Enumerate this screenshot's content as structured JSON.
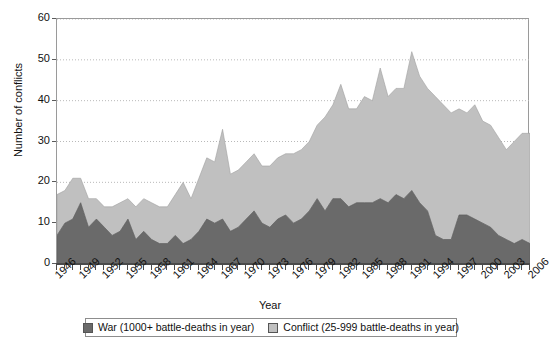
{
  "chart_data": {
    "type": "area",
    "stacked": true,
    "title": "",
    "xlabel": "Year",
    "ylabel": "Number of conflicts",
    "xlim": [
      1946,
      2006
    ],
    "ylim": [
      0,
      60
    ],
    "yticks": [
      0,
      10,
      20,
      30,
      40,
      50,
      60
    ],
    "xtick_labels": [
      "1946",
      "1949",
      "1952",
      "1955",
      "1958",
      "1961",
      "1964",
      "1967",
      "1970",
      "1973",
      "1976",
      "1979",
      "1982",
      "1985",
      "1988",
      "1991",
      "1994",
      "1997",
      "2000",
      "2003",
      "2006"
    ],
    "xtick_step": 3,
    "grid": "horizontal-dotted",
    "legend_position": "bottom",
    "x": [
      1946,
      1947,
      1948,
      1949,
      1950,
      1951,
      1952,
      1953,
      1954,
      1955,
      1956,
      1957,
      1958,
      1959,
      1960,
      1961,
      1962,
      1963,
      1964,
      1965,
      1966,
      1967,
      1968,
      1969,
      1970,
      1971,
      1972,
      1973,
      1974,
      1975,
      1976,
      1977,
      1978,
      1979,
      1980,
      1981,
      1982,
      1983,
      1984,
      1985,
      1986,
      1987,
      1988,
      1989,
      1990,
      1991,
      1992,
      1993,
      1994,
      1995,
      1996,
      1997,
      1998,
      1999,
      2000,
      2001,
      2002,
      2003,
      2004,
      2005,
      2006
    ],
    "series": [
      {
        "name": "War (1000+ battle-deaths in year)",
        "color": "#6a6a6a",
        "values": [
          7,
          10,
          11,
          15,
          9,
          11,
          9,
          7,
          8,
          11,
          6,
          8,
          6,
          5,
          5,
          7,
          5,
          6,
          8,
          11,
          10,
          11,
          8,
          9,
          11,
          13,
          10,
          9,
          11,
          12,
          10,
          11,
          13,
          16,
          13,
          16,
          16,
          14,
          15,
          15,
          15,
          16,
          15,
          17,
          16,
          18,
          15,
          13,
          7,
          6,
          6,
          12,
          12,
          11,
          10,
          9,
          7,
          6,
          5,
          6,
          5
        ]
      },
      {
        "name": "Conflict (25-999 battle-deaths in year)",
        "color": "#c0c0c0",
        "values": [
          10,
          8,
          10,
          6,
          7,
          5,
          5,
          7,
          7,
          5,
          8,
          8,
          9,
          9,
          9,
          10,
          15,
          10,
          13,
          15,
          15,
          22,
          14,
          14,
          14,
          14,
          14,
          15,
          15,
          15,
          17,
          17,
          17,
          18,
          23,
          23,
          28,
          24,
          23,
          26,
          25,
          32,
          26,
          26,
          27,
          34,
          31,
          30,
          34,
          33,
          31,
          26,
          25,
          28,
          25,
          25,
          24,
          22,
          25,
          26,
          27
        ]
      }
    ]
  },
  "legend": {
    "items": [
      {
        "label": "War (1000+ battle-deaths in year)",
        "color": "#6a6a6a"
      },
      {
        "label": "Conflict (25-999 battle-deaths in year)",
        "color": "#c0c0c0"
      }
    ]
  }
}
